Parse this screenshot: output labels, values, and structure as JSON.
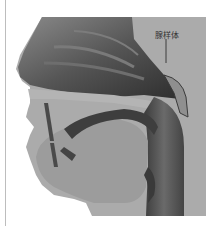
{
  "figure": {
    "label": "腺样体",
    "colors": {
      "background_panel": "#a9a9a9",
      "nasal_cavity_dark": "#4a4a4a",
      "tissue_light": "#9c9c9c",
      "airway_dark": "#3a3a3a",
      "skin_edge": "#b8b8b8"
    }
  }
}
